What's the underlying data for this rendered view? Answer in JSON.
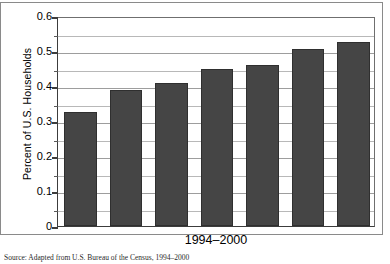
{
  "chart_data": {
    "type": "bar",
    "title": "",
    "subtitle": "",
    "xlabel": "1994–2000",
    "ylabel": "Percent of U.S. Households",
    "categories": [
      "1994",
      "1995",
      "1996",
      "1997",
      "1998",
      "1999",
      "2000"
    ],
    "values": [
      0.325,
      0.39,
      0.41,
      0.45,
      0.46,
      0.505,
      0.525
    ],
    "ylim": [
      0,
      0.6
    ],
    "xlim_categories": 7,
    "y_major_ticks": [
      0,
      0.1,
      0.2,
      0.3,
      0.4,
      0.5,
      0.6
    ],
    "y_major_tick_labels": [
      "0",
      "0.1",
      "0.2",
      "0.3",
      "0.4",
      "0.5",
      "0.6"
    ],
    "y_minor_ticks": [
      0.05,
      0.15,
      0.25,
      0.35,
      0.45,
      0.55
    ],
    "grid": true,
    "grid_axis": "y",
    "legend": false,
    "legend_position": "none",
    "bar_color": "#454545",
    "bar_edge_color": "#2f2f2f",
    "grid_color": "#9d9d9d",
    "axis_color": "#3c3c3c",
    "background_color": "#ffffff"
  },
  "axis": {
    "y_title": "Percent of U.S. Households",
    "x_title": "1994–2000"
  },
  "caption": {
    "text": "Source: Adapted from U.S. Bureau of the Census, 1994–2000"
  }
}
